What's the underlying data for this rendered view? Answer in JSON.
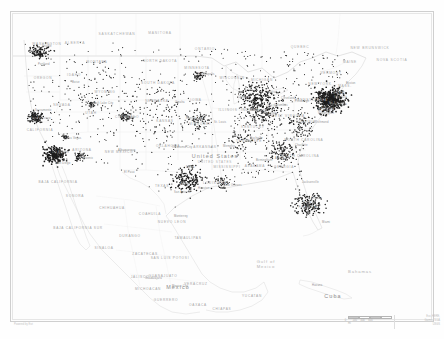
{
  "map": {
    "title": "United States dot density map",
    "type": "dot-density",
    "background_color": "#fdfdfd",
    "dot_color": "#1c1c1c",
    "border_color": "#cfcfcf",
    "label_color": "#9a9a9a",
    "countries": [
      {
        "name": "United States",
        "sub": "UNITED STATES",
        "x": 215,
        "y": 156
      },
      {
        "name": "Mexico",
        "sub": "",
        "x": 178,
        "y": 287
      },
      {
        "name": "Cuba",
        "sub": "",
        "x": 333,
        "y": 296
      }
    ],
    "water_labels": [
      {
        "name": "Gulf of\nMexico",
        "x": 266,
        "y": 264
      },
      {
        "name": "Bahamas",
        "x": 360,
        "y": 272
      }
    ],
    "provinces": [
      {
        "name": "SASKATCHEWAN",
        "x": 117,
        "y": 34
      },
      {
        "name": "MANITOBA",
        "x": 160,
        "y": 33
      },
      {
        "name": "ONTARIO",
        "x": 205,
        "y": 49
      },
      {
        "name": "QUEBEC",
        "x": 300,
        "y": 47
      },
      {
        "name": "ALBERTA",
        "x": 75,
        "y": 43
      },
      {
        "name": "NEW BRUNSWICK",
        "x": 370,
        "y": 48
      },
      {
        "name": "NOVA SCOTIA",
        "x": 392,
        "y": 60
      }
    ],
    "states": [
      {
        "name": "WASHINGTON",
        "x": 47,
        "y": 44
      },
      {
        "name": "MONTANA",
        "x": 97,
        "y": 62
      },
      {
        "name": "NORTH DAKOTA",
        "x": 160,
        "y": 61
      },
      {
        "name": "MINNESOTA",
        "x": 197,
        "y": 68
      },
      {
        "name": "WISCONSIN",
        "x": 232,
        "y": 78
      },
      {
        "name": "MICHIGAN",
        "x": 262,
        "y": 80
      },
      {
        "name": "OREGON",
        "x": 43,
        "y": 78
      },
      {
        "name": "IDAHO",
        "x": 74,
        "y": 75
      },
      {
        "name": "SOUTH DAKOTA",
        "x": 158,
        "y": 83
      },
      {
        "name": "WYOMING",
        "x": 105,
        "y": 92
      },
      {
        "name": "IOWA",
        "x": 196,
        "y": 100
      },
      {
        "name": "NEBRASKA",
        "x": 157,
        "y": 101
      },
      {
        "name": "ILLINOIS",
        "x": 228,
        "y": 110
      },
      {
        "name": "INDIANA",
        "x": 250,
        "y": 110
      },
      {
        "name": "OHIO",
        "x": 272,
        "y": 106
      },
      {
        "name": "PENNSYLVANIA",
        "x": 311,
        "y": 100
      },
      {
        "name": "NEW YORK",
        "x": 320,
        "y": 84
      },
      {
        "name": "NEVADA",
        "x": 62,
        "y": 105
      },
      {
        "name": "UTAH",
        "x": 91,
        "y": 113
      },
      {
        "name": "COLORADO",
        "x": 127,
        "y": 117
      },
      {
        "name": "KANSAS",
        "x": 165,
        "y": 121
      },
      {
        "name": "MISSOURI",
        "x": 200,
        "y": 124
      },
      {
        "name": "KENTUCKY",
        "x": 253,
        "y": 127
      },
      {
        "name": "WEST VIRGINIA",
        "x": 288,
        "y": 116
      },
      {
        "name": "VIRGINIA",
        "x": 306,
        "y": 122
      },
      {
        "name": "CALIFORNIA",
        "x": 40,
        "y": 130
      },
      {
        "name": "ARIZONA",
        "x": 82,
        "y": 150
      },
      {
        "name": "NEW MEXICO",
        "x": 119,
        "y": 152
      },
      {
        "name": "OKLAHOMA",
        "x": 168,
        "y": 146
      },
      {
        "name": "ARKANSAS",
        "x": 205,
        "y": 147
      },
      {
        "name": "TENNESSEE",
        "x": 249,
        "y": 141
      },
      {
        "name": "NORTH CAROLINA",
        "x": 304,
        "y": 140
      },
      {
        "name": "SOUTH CAROLINA",
        "x": 300,
        "y": 156
      },
      {
        "name": "GEORGIA",
        "x": 284,
        "y": 167
      },
      {
        "name": "ALABAMA",
        "x": 255,
        "y": 166
      },
      {
        "name": "MISSISSIPPI",
        "x": 227,
        "y": 167
      },
      {
        "name": "LOUISIANA",
        "x": 215,
        "y": 183
      },
      {
        "name": "TEXAS",
        "x": 162,
        "y": 186
      },
      {
        "name": "FLORIDA",
        "x": 308,
        "y": 207
      },
      {
        "name": "MAINE",
        "x": 350,
        "y": 62
      },
      {
        "name": "VERMONT",
        "x": 331,
        "y": 73
      },
      {
        "name": "MASS.",
        "x": 345,
        "y": 86
      },
      {
        "name": "CONN.",
        "x": 340,
        "y": 93
      },
      {
        "name": "N.J.",
        "x": 333,
        "y": 103
      },
      {
        "name": "MD.",
        "x": 322,
        "y": 110
      },
      {
        "name": "DEL.",
        "x": 332,
        "y": 110
      }
    ],
    "mexican_states": [
      {
        "name": "CHIHUAHUA",
        "x": 112,
        "y": 208
      },
      {
        "name": "COAHUILA",
        "x": 150,
        "y": 214
      },
      {
        "name": "SONORA",
        "x": 75,
        "y": 196
      },
      {
        "name": "DURANGO",
        "x": 130,
        "y": 236
      },
      {
        "name": "NUEVO LEON",
        "x": 172,
        "y": 222
      },
      {
        "name": "TAMAULIPAS",
        "x": 188,
        "y": 238
      },
      {
        "name": "ZACATECAS",
        "x": 145,
        "y": 254
      },
      {
        "name": "SINALOA",
        "x": 104,
        "y": 248
      },
      {
        "name": "SAN LUIS POTOSI",
        "x": 170,
        "y": 258
      },
      {
        "name": "JALISCO",
        "x": 140,
        "y": 277
      },
      {
        "name": "VERACRUZ",
        "x": 196,
        "y": 284
      },
      {
        "name": "GUANAJUATO",
        "x": 163,
        "y": 276
      },
      {
        "name": "OAXACA",
        "x": 198,
        "y": 305
      },
      {
        "name": "GUERRERO",
        "x": 166,
        "y": 300
      },
      {
        "name": "CHIAPAS",
        "x": 222,
        "y": 309
      },
      {
        "name": "YUCATAN",
        "x": 252,
        "y": 296
      },
      {
        "name": "MICHOACAN",
        "x": 148,
        "y": 289
      },
      {
        "name": "BAJA CALIFORNIA",
        "x": 58,
        "y": 182
      },
      {
        "name": "BAJA CALIFORNIA SUR",
        "x": 78,
        "y": 228
      }
    ],
    "cities": [
      {
        "name": "Seattle",
        "x": 40,
        "y": 46
      },
      {
        "name": "Portland",
        "x": 36,
        "y": 64
      },
      {
        "name": "Boise",
        "x": 70,
        "y": 82
      },
      {
        "name": "San Francisco",
        "x": 29,
        "y": 118
      },
      {
        "name": "Sacramento",
        "x": 33,
        "y": 110
      },
      {
        "name": "Las Vegas",
        "x": 65,
        "y": 138
      },
      {
        "name": "Los Angeles",
        "x": 50,
        "y": 152
      },
      {
        "name": "San Diego",
        "x": 54,
        "y": 163
      },
      {
        "name": "Phoenix",
        "x": 80,
        "y": 158
      },
      {
        "name": "Salt Lake City",
        "x": 92,
        "y": 103
      },
      {
        "name": "Denver",
        "x": 124,
        "y": 117
      },
      {
        "name": "Albuquerque",
        "x": 116,
        "y": 150
      },
      {
        "name": "El Paso",
        "x": 122,
        "y": 172
      },
      {
        "name": "Minneapolis",
        "x": 196,
        "y": 74
      },
      {
        "name": "Omaha",
        "x": 173,
        "y": 102
      },
      {
        "name": "Kansas City",
        "x": 184,
        "y": 118
      },
      {
        "name": "St. Louis",
        "x": 212,
        "y": 122
      },
      {
        "name": "Chicago",
        "x": 236,
        "y": 97
      },
      {
        "name": "Detroit",
        "x": 266,
        "y": 92
      },
      {
        "name": "Cleveland",
        "x": 279,
        "y": 98
      },
      {
        "name": "Indianapolis",
        "x": 248,
        "y": 110
      },
      {
        "name": "Columbus",
        "x": 272,
        "y": 105
      },
      {
        "name": "Cincinnati",
        "x": 261,
        "y": 113
      },
      {
        "name": "Pittsburgh",
        "x": 293,
        "y": 101
      },
      {
        "name": "New York",
        "x": 332,
        "y": 97
      },
      {
        "name": "Philadelphia",
        "x": 328,
        "y": 104
      },
      {
        "name": "Boston",
        "x": 344,
        "y": 83
      },
      {
        "name": "Washington",
        "x": 316,
        "y": 113
      },
      {
        "name": "Baltimore",
        "x": 319,
        "y": 108
      },
      {
        "name": "Richmond",
        "x": 313,
        "y": 122
      },
      {
        "name": "Charlotte",
        "x": 293,
        "y": 145
      },
      {
        "name": "Atlanta",
        "x": 273,
        "y": 158
      },
      {
        "name": "Nashville",
        "x": 248,
        "y": 138
      },
      {
        "name": "Memphis",
        "x": 221,
        "y": 146
      },
      {
        "name": "Birmingham",
        "x": 254,
        "y": 160
      },
      {
        "name": "Jacksonville",
        "x": 300,
        "y": 182
      },
      {
        "name": "Orlando",
        "x": 309,
        "y": 198
      },
      {
        "name": "Tampa",
        "x": 300,
        "y": 202
      },
      {
        "name": "Miami",
        "x": 320,
        "y": 222
      },
      {
        "name": "New Orleans",
        "x": 222,
        "y": 185
      },
      {
        "name": "Houston",
        "x": 196,
        "y": 188
      },
      {
        "name": "San Antonio",
        "x": 172,
        "y": 192
      },
      {
        "name": "Austin",
        "x": 178,
        "y": 184
      },
      {
        "name": "Dallas",
        "x": 184,
        "y": 167
      },
      {
        "name": "Oklahoma City",
        "x": 170,
        "y": 147
      },
      {
        "name": "Monterrey",
        "x": 172,
        "y": 216
      },
      {
        "name": "Mexico City",
        "x": 170,
        "y": 286
      },
      {
        "name": "Guadalajara",
        "x": 143,
        "y": 278
      },
      {
        "name": "Havana",
        "x": 310,
        "y": 285
      }
    ],
    "scalebar": {
      "segments": 4,
      "labels": [
        "0",
        "200",
        "400",
        "600"
      ],
      "unit": "mi"
    },
    "attribution": {
      "line1": "Esri, HERE,",
      "line2": "Garmin, NGA",
      "line3": "USGS"
    },
    "corner_note": "Powered by Esri"
  },
  "chart_data": {
    "type": "scatter",
    "xlabel": "Longitude",
    "ylabel": "Latitude",
    "clusters": [
      {
        "name": "Northeast Corridor (NY-Philadelphia-Boston-DC)",
        "cx": 330,
        "cy": 100,
        "count": 430,
        "spread": 16,
        "intensity": "very-high"
      },
      {
        "name": "Great Lakes (Chicago-Detroit-Cleveland)",
        "cx": 258,
        "cy": 98,
        "count": 230,
        "spread": 22,
        "intensity": "high"
      },
      {
        "name": "Southern California (LA-San Diego)",
        "cx": 55,
        "cy": 155,
        "count": 200,
        "spread": 12,
        "intensity": "very-high"
      },
      {
        "name": "San Francisco Bay Area",
        "cx": 36,
        "cy": 117,
        "count": 110,
        "spread": 8,
        "intensity": "high"
      },
      {
        "name": "Pacific Northwest (Seattle-Portland)",
        "cx": 40,
        "cy": 52,
        "count": 95,
        "spread": 10,
        "intensity": "high"
      },
      {
        "name": "Texas Triangle (Dallas-Houston-Austin)",
        "cx": 188,
        "cy": 180,
        "count": 165,
        "spread": 18,
        "intensity": "high"
      },
      {
        "name": "Florida (Miami-Tampa-Orlando)",
        "cx": 310,
        "cy": 205,
        "count": 150,
        "spread": 17,
        "intensity": "high"
      },
      {
        "name": "Southeast Piedmont (Atlanta-Charlotte)",
        "cx": 283,
        "cy": 152,
        "count": 120,
        "spread": 16,
        "intensity": "medium"
      },
      {
        "name": "Ohio Valley",
        "cx": 262,
        "cy": 116,
        "count": 95,
        "spread": 16,
        "intensity": "medium"
      },
      {
        "name": "Front Range (Denver)",
        "cx": 124,
        "cy": 117,
        "count": 55,
        "spread": 7,
        "intensity": "medium"
      },
      {
        "name": "Phoenix",
        "cx": 80,
        "cy": 157,
        "count": 48,
        "spread": 6,
        "intensity": "medium"
      },
      {
        "name": "Minneapolis-St. Paul",
        "cx": 198,
        "cy": 76,
        "count": 45,
        "spread": 6,
        "intensity": "medium"
      },
      {
        "name": "Missouri (Kansas City-St. Louis)",
        "cx": 198,
        "cy": 120,
        "count": 60,
        "spread": 14,
        "intensity": "medium"
      },
      {
        "name": "Tennessee Valley",
        "cx": 240,
        "cy": 142,
        "count": 55,
        "spread": 16,
        "intensity": "medium"
      },
      {
        "name": "Gulf Coast (New Orleans)",
        "cx": 222,
        "cy": 184,
        "count": 40,
        "spread": 10,
        "intensity": "medium"
      },
      {
        "name": "Salt Lake City",
        "cx": 92,
        "cy": 104,
        "count": 30,
        "spread": 5,
        "intensity": "low"
      },
      {
        "name": "Las Vegas",
        "cx": 65,
        "cy": 137,
        "count": 25,
        "spread": 4,
        "intensity": "low"
      },
      {
        "name": "Great Plains scatter",
        "cx": 160,
        "cy": 110,
        "count": 130,
        "spread": 42,
        "intensity": "low"
      },
      {
        "name": "Mountain West scatter",
        "cx": 95,
        "cy": 95,
        "count": 70,
        "spread": 40,
        "intensity": "low"
      },
      {
        "name": "Mid-Atlantic inland",
        "cx": 300,
        "cy": 125,
        "count": 80,
        "spread": 18,
        "intensity": "medium"
      }
    ]
  }
}
